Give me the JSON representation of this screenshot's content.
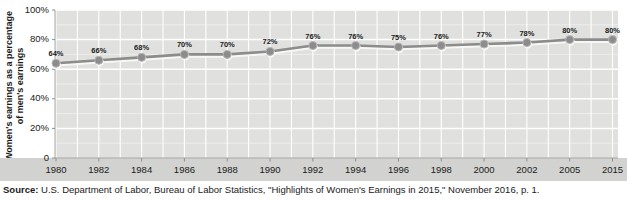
{
  "chart_data": {
    "type": "line",
    "categories": [
      "1980",
      "1982",
      "1984",
      "1986",
      "1988",
      "1990",
      "1992",
      "1994",
      "1996",
      "1998",
      "2000",
      "2002",
      "2005",
      "2015"
    ],
    "values": [
      64,
      66,
      68,
      70,
      70,
      72,
      76,
      76,
      75,
      76,
      77,
      78,
      80,
      80
    ],
    "point_label_suffix": "%",
    "title": "",
    "xlabel": "",
    "ylabel": "Women's earnings as a percentage of men's earnings",
    "ylabel_lines": [
      "Women's earnings as a percentage",
      "of men's earnings"
    ],
    "ylim": [
      0,
      100
    ],
    "y_tick_values": [
      0,
      20,
      40,
      60,
      80,
      100
    ],
    "y_tick_labels": [
      "0",
      "20%",
      "40%",
      "60%",
      "80%",
      "100%"
    ],
    "grid": true,
    "legend": "none",
    "colors": {
      "plot_background": "#e0e1de",
      "axis_band_background": "#d2d3d0",
      "gridline": "#ffffff",
      "minor_gridline": "rgba(255,255,255,0.45)",
      "line": "#8c8c8c",
      "marker_fill": "#8c8c8c",
      "marker_stroke": "#b5b5b5",
      "line_shadow": "#f7f7f6",
      "axis_line": "#a8a8a6",
      "tick": "#8f8f8d",
      "text": "#1a1a1a"
    }
  },
  "source": {
    "prefix": "Source:",
    "text": " U.S. Department of Labor, Bureau of Labor Statistics, \"Highlights of Women's Earnings in 2015,\" November 2016, p. 1."
  }
}
